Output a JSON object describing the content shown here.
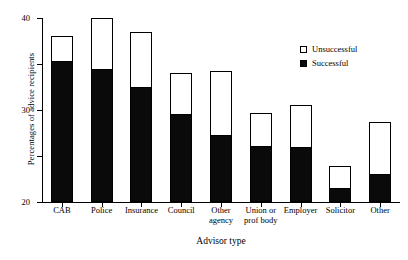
{
  "chart_data": {
    "type": "bar",
    "subtype": "stacked-vertical",
    "title": "",
    "xlabel": "Advisor type",
    "ylabel": "Percentages of advice recipients",
    "ylim": [
      0,
      40
    ],
    "yticks": [
      0,
      10,
      20,
      30,
      40
    ],
    "grid": false,
    "legend_position": "top-right",
    "categories": [
      "CAB",
      "Police",
      "Insurance",
      "Council",
      "Other\nagency",
      "Union or\nprof body",
      "Employer",
      "Solicitor",
      "Other"
    ],
    "series": [
      {
        "name": "Successful",
        "color": "#0a0a0a",
        "values": [
          30.7,
          29.0,
          25.0,
          19.2,
          14.5,
          12.2,
          12.0,
          3.0,
          6.0
        ]
      },
      {
        "name": "Unsuccessful",
        "color": "#ffffff",
        "values": [
          5.3,
          11.0,
          12.0,
          8.8,
          14.0,
          7.1,
          9.0,
          4.8,
          11.5
        ]
      }
    ],
    "totals": [
      36.0,
      40.0,
      37.0,
      28.0,
      28.5,
      19.3,
      21.0,
      7.8,
      17.5
    ]
  },
  "legend": {
    "items": [
      {
        "label": "Unsuccessful",
        "style": "open"
      },
      {
        "label": "Successful",
        "style": "filled"
      }
    ]
  },
  "axes": {
    "y_title": "Percentages of advice recipients",
    "x_title": "Advisor type",
    "y_tick_labels": [
      "0",
      "10",
      "20",
      "30",
      "40"
    ]
  }
}
